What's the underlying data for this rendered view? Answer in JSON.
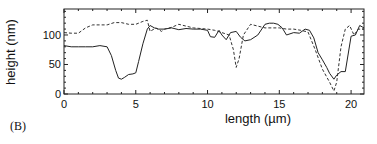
{
  "panel_label": "(B)",
  "chart_data": {
    "type": "line",
    "title": "",
    "xlabel": "length (µm)",
    "ylabel": "height (nm)",
    "xlim": [
      0,
      20.9
    ],
    "ylim": [
      0,
      144
    ],
    "xticks": [
      0,
      5,
      10,
      15,
      20
    ],
    "yticks": [
      0,
      50,
      100
    ],
    "grid": false,
    "legend": null,
    "series": [
      {
        "name": "solid profile",
        "style": "solid",
        "x": [
          0,
          0.5,
          1,
          1.5,
          2,
          2.5,
          3,
          3.3,
          3.6,
          3.8,
          4.0,
          4.2,
          4.5,
          4.8,
          5.0,
          5.2,
          5.5,
          5.8,
          6.0,
          6.3,
          6.6,
          7,
          7.5,
          8,
          8.5,
          9,
          9.5,
          10,
          10.2,
          10.5,
          10.8,
          11.0,
          11.3,
          11.6,
          12.0,
          12.3,
          12.6,
          13.0,
          13.5,
          14.0,
          14.3,
          14.6,
          14.9,
          15.2,
          15.5,
          16.0,
          16.4,
          16.8,
          17.1,
          17.4,
          17.7,
          18.0,
          18.3,
          18.5,
          18.8,
          19.0,
          19.3,
          19.6,
          20.0,
          20.3,
          20.6,
          20.9
        ],
        "y": [
          82,
          80,
          80,
          80,
          80,
          82,
          80,
          65,
          40,
          27,
          25,
          28,
          33,
          34,
          36,
          55,
          85,
          110,
          116,
          112,
          110,
          110,
          112,
          109,
          111,
          110,
          110,
          108,
          97,
          96,
          108,
          100,
          92,
          104,
          106,
          96,
          90,
          92,
          100,
          118,
          120,
          120,
          118,
          112,
          100,
          104,
          103,
          110,
          108,
          95,
          70,
          58,
          45,
          35,
          25,
          32,
          38,
          38,
          98,
          100,
          116,
          112
        ],
        "values_note": "estimated from axes"
      },
      {
        "name": "dashed profile",
        "style": "dashed",
        "x": [
          0,
          0.5,
          1,
          1.5,
          2,
          2.5,
          3,
          3.5,
          4.0,
          4.5,
          5.0,
          5.5,
          5.8,
          6.0,
          6.4,
          6.8,
          7,
          7.5,
          8,
          9,
          10,
          10.5,
          11.0,
          11.5,
          11.8,
          12.0,
          12.2,
          12.5,
          13.0,
          13.5,
          14.0,
          14.5,
          15.0,
          15.5,
          16,
          16.5,
          17.0,
          17.5,
          18.0,
          18.5,
          18.8,
          19.0,
          19.3,
          19.6,
          19.9,
          20.2,
          20.5,
          20.9
        ],
        "y": [
          104,
          103,
          103,
          112,
          117,
          117,
          117,
          121,
          121,
          118,
          118,
          123,
          125,
          106,
          112,
          106,
          110,
          113,
          118,
          112,
          110,
          108,
          104,
          100,
          75,
          45,
          60,
          100,
          118,
          115,
          112,
          112,
          112,
          110,
          110,
          108,
          105,
          75,
          42,
          20,
          5,
          20,
          80,
          110,
          116,
          100,
          110,
          110
        ],
        "values_note": "estimated from axes"
      }
    ]
  }
}
